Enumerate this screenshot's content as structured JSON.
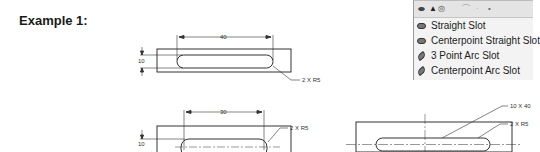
{
  "heading": {
    "title": "Example 1:"
  },
  "drawing1": {
    "width_dim": "40",
    "height_dim": "10",
    "radius_note": "2 X R5"
  },
  "drawing2": {
    "width_dim": "30",
    "height_dim": "10",
    "radius_note": "2 X R5"
  },
  "drawing3": {
    "size_note": "10 X 40",
    "radius_note": "2 X R5"
  },
  "slot_menu": {
    "toolbar_icons": [
      "straight-slot-icon",
      "centerpoint-slot-icon",
      "arc-icon",
      "point-icon"
    ],
    "items": [
      {
        "label": "Straight Slot",
        "icon": "straight-slot-icon"
      },
      {
        "label": "Centerpoint Straight Slot",
        "icon": "centerpoint-straight-slot-icon"
      },
      {
        "label": "3 Point Arc Slot",
        "icon": "three-point-arc-slot-icon"
      },
      {
        "label": "Centerpoint Arc Slot",
        "icon": "centerpoint-arc-slot-icon"
      }
    ]
  }
}
